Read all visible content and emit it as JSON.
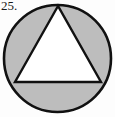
{
  "figure": {
    "label": "25.",
    "type": "geometry-diagram",
    "colors": {
      "background": "#fdfdfd",
      "shaded_region": "#bdbdbd",
      "triangle_fill": "#ffffff",
      "stroke": "#111111",
      "label_color": "#1a1a1a"
    },
    "circle": {
      "name": "outer-circle",
      "cx": 57.5,
      "cy": 58.5,
      "r": 53.5,
      "stroke_width": 2.6,
      "fill": "#bdbdbd"
    },
    "triangle": {
      "name": "inscribed-triangle",
      "points": "58,6 15,82 101,82",
      "apex": {
        "x": 58,
        "y": 6
      },
      "base_left": {
        "x": 15,
        "y": 82
      },
      "base_right": {
        "x": 101,
        "y": 82
      },
      "stroke_width": 2.4,
      "fill": "#ffffff"
    }
  }
}
